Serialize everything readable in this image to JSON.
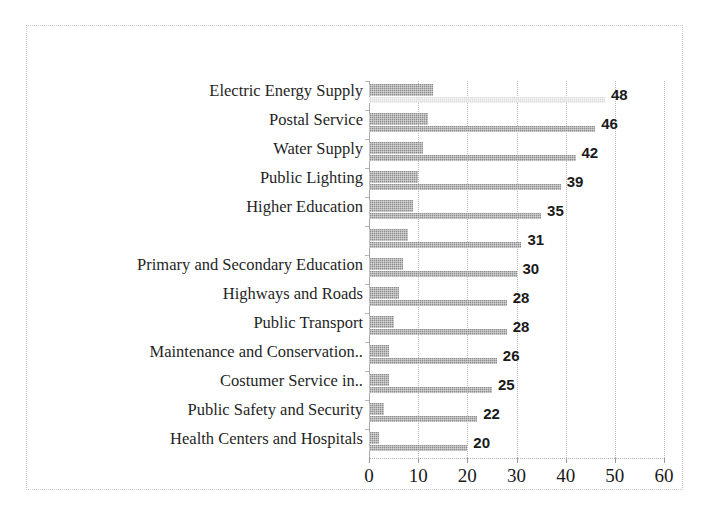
{
  "chart_data": {
    "type": "bar",
    "orientation": "horizontal",
    "title": "",
    "subtitle": "",
    "xlabel": "",
    "ylabel": "",
    "xlim": [
      0,
      60
    ],
    "xticks": [
      0,
      10,
      20,
      30,
      40,
      50,
      60
    ],
    "grid": true,
    "legend": "none",
    "categories": [
      "Electric Energy Supply",
      "Postal Service",
      "Water Supply",
      "Public Lighting",
      "Higher Education",
      "",
      "Primary and Secondary Education",
      "Highways and Roads",
      "Public Transport",
      "Maintenance and Conservation..",
      "Costumer Service in..",
      "Public Safety and Security",
      "Health Centers and Hospitals"
    ],
    "series": [
      {
        "name": "series-1",
        "values": [
          13,
          12,
          11,
          10,
          9,
          8,
          7,
          6,
          5,
          4,
          4,
          3,
          2
        ]
      },
      {
        "name": "series-2",
        "values": [
          48,
          46,
          42,
          39,
          35,
          31,
          30,
          28,
          28,
          26,
          25,
          22,
          20
        ]
      }
    ],
    "value_labels": [
      48,
      46,
      42,
      39,
      35,
      31,
      30,
      28,
      28,
      26,
      25,
      22,
      20
    ],
    "colors": {
      "bar_primary": "#8f8f8f",
      "bar_secondary": "#8f8f8f",
      "bar_secondary_first": "#d8d8d8",
      "gridline": "#bdbdbd",
      "axis": "#a8a8a8",
      "text": "#1a1a1a",
      "frame": "#c9c9c9",
      "background": "#ffffff"
    }
  }
}
